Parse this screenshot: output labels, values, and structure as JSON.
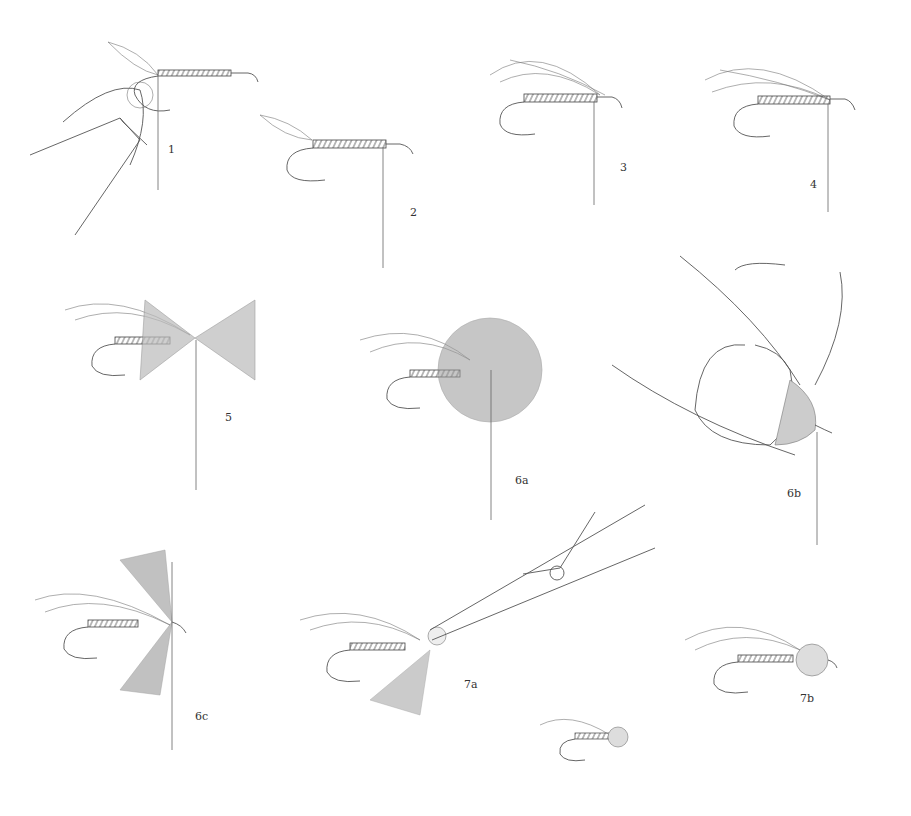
{
  "plate": {
    "description": "Fly tying step-by-step illustration: muddler-style fly with deer hair collar",
    "steps": [
      {
        "id": "1",
        "label": "1",
        "x": 168,
        "y": 150
      },
      {
        "id": "2",
        "label": "2",
        "x": 410,
        "y": 210
      },
      {
        "id": "3",
        "label": "3",
        "x": 620,
        "y": 170
      },
      {
        "id": "4",
        "label": "4",
        "x": 810,
        "y": 186
      },
      {
        "id": "5",
        "label": "5",
        "x": 225,
        "y": 410
      },
      {
        "id": "6a",
        "label": "6a",
        "x": 517,
        "y": 472
      },
      {
        "id": "6b",
        "label": "6b",
        "x": 787,
        "y": 485
      },
      {
        "id": "6c",
        "label": "6c",
        "x": 195,
        "y": 710
      },
      {
        "id": "7a",
        "label": "7a",
        "x": 465,
        "y": 680
      },
      {
        "id": "7b",
        "label": "7b",
        "x": 800,
        "y": 695
      }
    ],
    "colors": {
      "ink": "#555555",
      "background": "#ffffff"
    }
  }
}
